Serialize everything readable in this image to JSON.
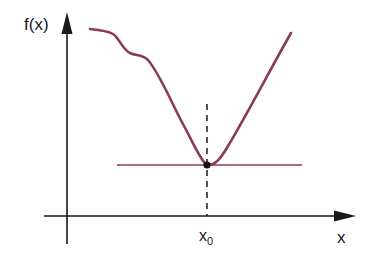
{
  "diagram": {
    "y_axis_label": "f(x)",
    "x_axis_label": "x",
    "x0_label_main": "x",
    "x0_label_sub": "0",
    "colors": {
      "curve": "#8b3a5c",
      "tangent": "#8b3a5c",
      "axes": "#1a1a1a",
      "point": "#111111"
    },
    "elements": [
      "function curve f(x) with local minimum at x0",
      "horizontal tangent line at minimum",
      "dashed vertical line at x0",
      "minimum point marker"
    ]
  }
}
